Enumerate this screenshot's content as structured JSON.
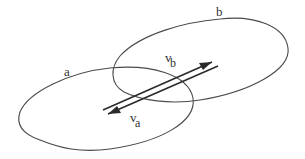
{
  "diagram": {
    "type": "two overlapping regions with opposite velocity vectors",
    "regions": [
      {
        "id": "a",
        "label": "a"
      },
      {
        "id": "b",
        "label": "b"
      }
    ],
    "vectors": [
      {
        "id": "vb",
        "label_main": "v",
        "label_sub": "b",
        "direction": "up-right"
      },
      {
        "id": "va",
        "label_main": "v",
        "label_sub": "a",
        "direction": "down-left"
      }
    ],
    "colors": {
      "background": "#ffffff",
      "stroke": "#4a4a4a",
      "arrow": "#2a2a2a",
      "text": "#333333"
    }
  }
}
